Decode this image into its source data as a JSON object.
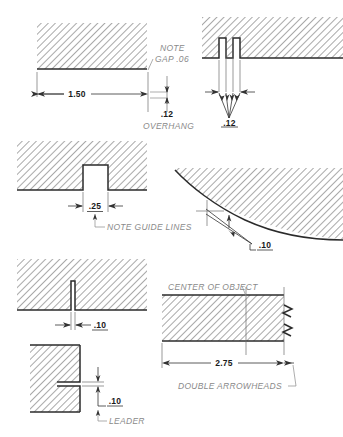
{
  "sheet": {
    "title": "Dimensioning Practice Detail Sheet",
    "background_color": "#ffffff",
    "line_color": "#2b2b2b",
    "note_color": "#8a8a8a",
    "hatch_color": "#999999"
  },
  "figures": [
    {
      "id": "fig-overhang",
      "name": "overhang-and-gap-detail",
      "dimension_values": [
        "1.50",
        ".12"
      ],
      "notes": [
        "NOTE",
        "GAP .06",
        "OVERHANG"
      ]
    },
    {
      "id": "fig-double-slot",
      "name": "double-slot-converging-arrows-detail",
      "dimension_values": [
        ".12"
      ],
      "notes": []
    },
    {
      "id": "fig-notch",
      "name": "notch-guide-lines-detail",
      "dimension_values": [
        ".25"
      ],
      "notes": [
        "NOTE GUIDE LINES"
      ]
    },
    {
      "id": "fig-curve",
      "name": "curved-surface-narrow-gap-detail",
      "dimension_values": [
        ".10"
      ],
      "notes": []
    },
    {
      "id": "fig-thin-slot",
      "name": "thin-vertical-slot-detail",
      "dimension_values": [
        ".10"
      ],
      "notes": []
    },
    {
      "id": "fig-center",
      "name": "center-of-object-break-detail",
      "dimension_values": [
        "2.75"
      ],
      "notes": [
        "CENTER OF OBJECT",
        "DOUBLE ARROWHEADS"
      ]
    },
    {
      "id": "fig-leader",
      "name": "horizontal-slot-leader-detail",
      "dimension_values": [
        ".10"
      ],
      "notes": [
        "LEADER"
      ]
    }
  ],
  "labels": {
    "note": "NOTE",
    "gap_06": "GAP .06",
    "dim_150": "1.50",
    "dim_12_overhang": ".12",
    "overhang": "OVERHANG",
    "dim_12_slot": ".12",
    "dim_25": ".25",
    "note_guide_lines": "NOTE GUIDE LINES",
    "dim_10_curve": ".10",
    "dim_10_slot": ".10",
    "center_of_object": "CENTER OF OBJECT",
    "dim_275": "2.75",
    "double_arrowheads": "DOUBLE ARROWHEADS",
    "dim_10_leader": ".10",
    "leader": "LEADER"
  }
}
